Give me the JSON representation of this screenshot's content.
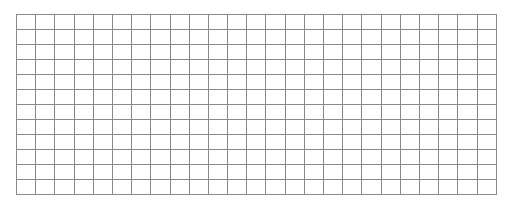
{
  "grid": {
    "columns": 25,
    "rows": 12,
    "cell_width": 19.2,
    "cell_height": 15,
    "line_color": "#8a8a8a",
    "background": "#ffffff"
  }
}
